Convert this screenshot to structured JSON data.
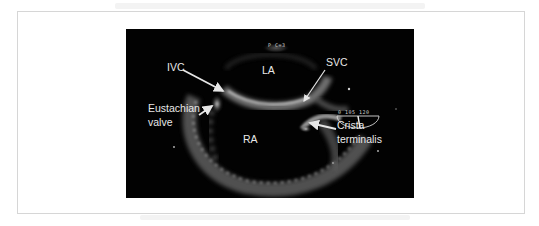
{
  "figure": {
    "type": "transesophageal echocardiogram",
    "labels": {
      "ivc": "IVC",
      "la": "LA",
      "svc": "SVC",
      "eustachian_line1": "Eustachian",
      "eustachian_line2": "valve",
      "ra": "RA",
      "crista_line1": "Crista",
      "crista_line2": "terminalis"
    },
    "overlay": {
      "top_marker": "P C=3",
      "angle_readout": "0 105 120"
    },
    "colors": {
      "panel_bg": "#020202",
      "label_text": "#e8e8e8",
      "arrow": "#e6e6e6",
      "frame_border": "#d6d6d6"
    }
  }
}
